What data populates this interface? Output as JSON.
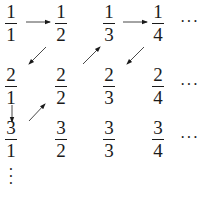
{
  "diagram": {
    "rows": [
      [
        {
          "num": "1",
          "den": "1"
        },
        {
          "num": "1",
          "den": "2"
        },
        {
          "num": "1",
          "den": "3"
        },
        {
          "num": "1",
          "den": "4"
        }
      ],
      [
        {
          "num": "2",
          "den": "1"
        },
        {
          "num": "2",
          "den": "2"
        },
        {
          "num": "2",
          "den": "3"
        },
        {
          "num": "2",
          "den": "4"
        }
      ],
      [
        {
          "num": "3",
          "den": "1"
        },
        {
          "num": "3",
          "den": "2"
        },
        {
          "num": "3",
          "den": "3"
        },
        {
          "num": "3",
          "den": "4"
        }
      ]
    ],
    "row_continuation": "···",
    "column_continuation": "⋮",
    "arrows": [
      {
        "from": "1/1",
        "to": "1/2",
        "direction": "right"
      },
      {
        "from": "1/2",
        "to": "2/1",
        "direction": "down-left"
      },
      {
        "from": "2/1",
        "to": "3/1",
        "direction": "down"
      },
      {
        "from": "3/1",
        "to": "2/2",
        "direction": "up-right"
      },
      {
        "from": "2/2",
        "to": "1/3",
        "direction": "up-right"
      },
      {
        "from": "1/3",
        "to": "1/4",
        "direction": "right"
      },
      {
        "from": "1/4",
        "to": "2/3",
        "direction": "down-left"
      }
    ],
    "colors": {
      "ink": "#1a1a1a",
      "background": "#ffffff"
    }
  }
}
